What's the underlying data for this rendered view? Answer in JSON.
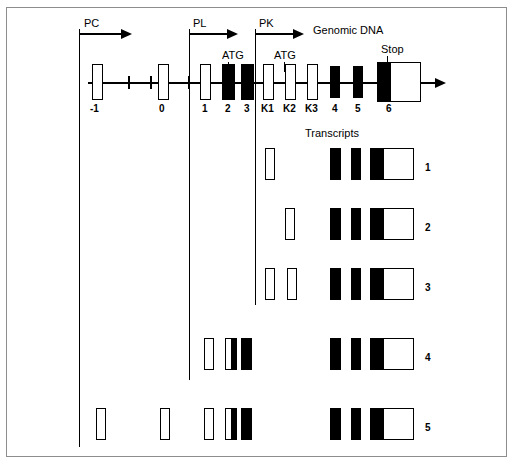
{
  "figure": {
    "title": "Genomic DNA",
    "transcripts_heading": "Transcripts"
  },
  "promoters": [
    {
      "name": "PC",
      "label_x": 84,
      "label_y": 18,
      "stem_x": 79,
      "stem_top": 29,
      "arrow_y": 33,
      "arrow_len": 42,
      "guide_bottom": 447
    },
    {
      "name": "PL",
      "label_x": 193,
      "label_y": 18,
      "stem_x": 189,
      "stem_top": 29,
      "arrow_y": 33,
      "arrow_len": 38,
      "guide_bottom": 380
    },
    {
      "name": "PK",
      "label_x": 259,
      "label_y": 18,
      "stem_x": 255,
      "stem_top": 29,
      "arrow_y": 33,
      "arrow_len": 38,
      "guide_bottom": 305
    }
  ],
  "annotations": [
    {
      "text": "ATG",
      "label_x": 222,
      "label_y": 50,
      "lead_x": 228,
      "lead_top": 62,
      "lead_bottom": 72
    },
    {
      "text": "ATG",
      "label_x": 274,
      "label_y": 50,
      "lead_x": 284,
      "lead_top": 62,
      "lead_bottom": 72
    },
    {
      "text": "Stop",
      "label_x": 381,
      "label_y": 44,
      "lead_x": 387,
      "lead_top": 56,
      "lead_bottom": 68
    }
  ],
  "genomic": {
    "axis_y": 82,
    "axis_segments": [
      {
        "x": 88,
        "w": 115
      },
      {
        "x": 203,
        "w": 232
      }
    ],
    "break_ticks": [
      128,
      150
    ],
    "arrow_x": 435,
    "exons": [
      {
        "name": "-1",
        "x": 92,
        "y": 64,
        "w": 11,
        "h": 36,
        "fill": "white",
        "label": "-1",
        "label_x": 90,
        "label_y": 103
      },
      {
        "name": "0",
        "x": 158,
        "y": 64,
        "w": 11,
        "h": 36,
        "fill": "white",
        "label": "0",
        "label_x": 159,
        "label_y": 103
      },
      {
        "name": "1",
        "x": 200,
        "y": 64,
        "w": 11,
        "h": 36,
        "fill": "white",
        "label": "1",
        "label_x": 202,
        "label_y": 103
      },
      {
        "name": "2",
        "x": 222,
        "y": 64,
        "w": 13,
        "h": 36,
        "fill": "black",
        "label": "2",
        "label_x": 225,
        "label_y": 103
      },
      {
        "name": "3",
        "x": 241,
        "y": 64,
        "w": 13,
        "h": 36,
        "fill": "black",
        "label": "3",
        "label_x": 244,
        "label_y": 103
      },
      {
        "name": "K1",
        "x": 263,
        "y": 64,
        "w": 11,
        "h": 36,
        "fill": "white",
        "label": "K1",
        "label_x": 261,
        "label_y": 103
      },
      {
        "name": "K2",
        "x": 285,
        "y": 64,
        "w": 11,
        "h": 36,
        "fill": "white",
        "label": "K2",
        "label_x": 283,
        "label_y": 103
      },
      {
        "name": "K3",
        "x": 307,
        "y": 64,
        "w": 11,
        "h": 36,
        "fill": "white",
        "label": "K3",
        "label_x": 305,
        "label_y": 103
      },
      {
        "name": "4",
        "x": 330,
        "y": 66,
        "w": 10,
        "h": 32,
        "fill": "black",
        "label": "4",
        "label_x": 332,
        "label_y": 103
      },
      {
        "name": "5",
        "x": 353,
        "y": 66,
        "w": 10,
        "h": 32,
        "fill": "black",
        "label": "5",
        "label_x": 355,
        "label_y": 103
      },
      {
        "name": "6",
        "x": 377,
        "y": 62,
        "w": 44,
        "h": 40,
        "fill": "bigstop",
        "label": "6",
        "label_x": 386,
        "label_y": 103
      }
    ]
  },
  "transcripts_heading_pos": {
    "x": 305,
    "y": 133
  },
  "transcripts": [
    {
      "number": "1",
      "num_x": 425,
      "num_y": 162,
      "y": 148,
      "h": 32,
      "boxes": [
        {
          "x": 265,
          "w": 10,
          "fill": "white"
        },
        {
          "x": 330,
          "w": 11,
          "fill": "black"
        },
        {
          "x": 351,
          "w": 10,
          "fill": "black"
        },
        {
          "x": 370,
          "w": 44,
          "fill": "bigstop"
        }
      ]
    },
    {
      "number": "2",
      "num_x": 425,
      "num_y": 222,
      "y": 208,
      "h": 32,
      "boxes": [
        {
          "x": 285,
          "w": 10,
          "fill": "white"
        },
        {
          "x": 330,
          "w": 11,
          "fill": "black"
        },
        {
          "x": 351,
          "w": 10,
          "fill": "black"
        },
        {
          "x": 370,
          "w": 44,
          "fill": "bigstop"
        }
      ]
    },
    {
      "number": "3",
      "num_x": 425,
      "num_y": 282,
      "y": 268,
      "h": 32,
      "boxes": [
        {
          "x": 265,
          "w": 10,
          "fill": "white"
        },
        {
          "x": 287,
          "w": 10,
          "fill": "white"
        },
        {
          "x": 330,
          "w": 11,
          "fill": "black"
        },
        {
          "x": 351,
          "w": 10,
          "fill": "black"
        },
        {
          "x": 370,
          "w": 44,
          "fill": "bigstop"
        }
      ]
    },
    {
      "number": "4",
      "num_x": 425,
      "num_y": 352,
      "y": 338,
      "h": 32,
      "boxes": [
        {
          "x": 204,
          "w": 10,
          "fill": "white"
        },
        {
          "x": 225,
          "w": 12,
          "fill": "halfL"
        },
        {
          "x": 241,
          "w": 11,
          "fill": "black"
        },
        {
          "x": 330,
          "w": 11,
          "fill": "black"
        },
        {
          "x": 351,
          "w": 10,
          "fill": "black"
        },
        {
          "x": 370,
          "w": 44,
          "fill": "bigstop"
        }
      ]
    },
    {
      "number": "5",
      "num_x": 425,
      "num_y": 422,
      "y": 408,
      "h": 32,
      "boxes": [
        {
          "x": 96,
          "w": 10,
          "fill": "white"
        },
        {
          "x": 160,
          "w": 10,
          "fill": "white"
        },
        {
          "x": 204,
          "w": 10,
          "fill": "white"
        },
        {
          "x": 225,
          "w": 12,
          "fill": "halfL"
        },
        {
          "x": 241,
          "w": 11,
          "fill": "black"
        },
        {
          "x": 330,
          "w": 11,
          "fill": "black"
        },
        {
          "x": 351,
          "w": 10,
          "fill": "black"
        },
        {
          "x": 370,
          "w": 44,
          "fill": "bigstop"
        }
      ]
    }
  ],
  "colors": {
    "coding": "#000000",
    "noncoding": "#ffffff",
    "stroke": "#000000",
    "frame": "#8d8d8d"
  }
}
